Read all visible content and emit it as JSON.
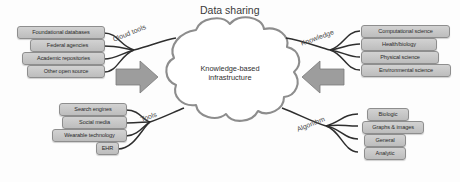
{
  "diagram": {
    "title": "Data sharing",
    "center": {
      "label": "Knowledge-based\ninfrastructure",
      "shape": "cloud"
    },
    "colors": {
      "box_fill": "#c8c8c8",
      "box_stroke": "#8e8e8e",
      "cloud_stroke": "#8d8d8d",
      "arrow_fill": "#9a9a9a",
      "connector": "#2e2e2e",
      "text": "#2b2b2b",
      "background": "#fdfdfd"
    },
    "groups": [
      {
        "id": "sources-top-left",
        "side": "left",
        "path_label": "Cloud tools",
        "items": [
          {
            "label": "Foundational databases"
          },
          {
            "label": "Federal agencies"
          },
          {
            "label": "Academic repositories"
          },
          {
            "label": "Other open source"
          }
        ]
      },
      {
        "id": "sources-bottom-left",
        "side": "left",
        "path_label": "Tools",
        "items": [
          {
            "label": "Search engines"
          },
          {
            "label": "Social media"
          },
          {
            "label": "Wearable technology"
          },
          {
            "label": "EHR"
          }
        ]
      },
      {
        "id": "outputs-top-right",
        "side": "right",
        "path_label": "Knowledge",
        "items": [
          {
            "label": "Computational science"
          },
          {
            "label": "Health/biology"
          },
          {
            "label": "Physical science"
          },
          {
            "label": "Environmental science"
          }
        ]
      },
      {
        "id": "outputs-bottom-right",
        "side": "right",
        "path_label": "Algorithm",
        "items": [
          {
            "label": "Biologic"
          },
          {
            "label": "Graphs & images"
          },
          {
            "label": "General"
          },
          {
            "label": "Analytic"
          }
        ]
      }
    ],
    "arrows": [
      {
        "id": "arrow-left-inbound",
        "direction": "right"
      },
      {
        "id": "arrow-right-outbound",
        "direction": "left"
      }
    ]
  }
}
